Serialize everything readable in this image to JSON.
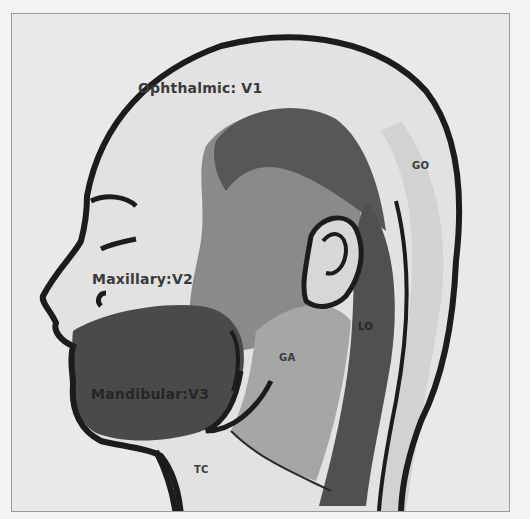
{
  "figure": {
    "colors": {
      "background": "#f4f4f4",
      "skin_light": "#e3e3e3",
      "region_v2_mid": "#8e8e8e",
      "region_dark": "#565656",
      "region_v3": "#4a4a4a",
      "outline": "#1c1c1c"
    },
    "labels": {
      "v1": "Ophthalmic: V1",
      "v2": "Maxillary:V2",
      "v3": "Mandibular:V3",
      "go": "GO",
      "lo": "LO",
      "ga": "GA",
      "tc": "TC"
    }
  }
}
